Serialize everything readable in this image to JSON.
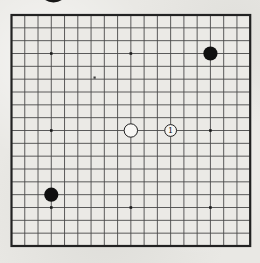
{
  "page": {
    "paper_color": "#e9e8e4"
  },
  "diagram": {
    "kind": "go-board",
    "board_size": 19,
    "colors": {
      "board_fill": "#ebeae6",
      "grid_line": "#4a4a4a",
      "border": "#222222",
      "star_point": "#1b1b1b",
      "black_stone": "#101010",
      "white_stone_fill": "#f7f6f3",
      "stone_outline": "#1f1f1f",
      "label_color": "#0a0a0a"
    },
    "visible_star_points": [
      {
        "col": 4,
        "row": 4
      },
      {
        "col": 10,
        "row": 4
      },
      {
        "col": 4,
        "row": 10
      },
      {
        "col": 16,
        "row": 10
      },
      {
        "col": 4,
        "row": 16
      },
      {
        "col": 10,
        "row": 16
      },
      {
        "col": 16,
        "row": 16
      }
    ],
    "stones": [
      {
        "color": "black",
        "col": 16,
        "row": 4,
        "label": ""
      },
      {
        "color": "black",
        "col": 4,
        "row": 15,
        "label": ""
      },
      {
        "color": "white",
        "col": 10,
        "row": 10,
        "label": ""
      },
      {
        "color": "white",
        "col": 13,
        "row": 10,
        "label": "1"
      }
    ],
    "artifacts": {
      "cropped_circle_top": {
        "cx": 53.5,
        "cy": -6.5,
        "rx": 12,
        "ry": 9,
        "color": "#161616"
      },
      "speck": {
        "x": 93.5,
        "y": 76.5,
        "w": 2.2,
        "h": 2.2,
        "color": "#3f3f3f"
      }
    }
  }
}
